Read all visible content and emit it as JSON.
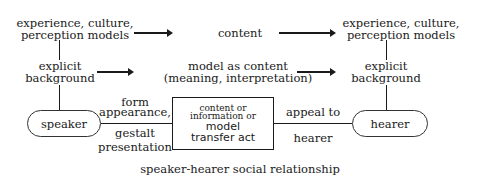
{
  "diagram": {
    "top_left": {
      "line1": "experience, culture,",
      "line2": "perception models"
    },
    "top_center": "content",
    "top_right": {
      "line1": "experience, culture,",
      "line2": "perception models"
    },
    "mid_left": {
      "line1": "explicit",
      "line2": "background"
    },
    "mid_center": {
      "line1": "model as content",
      "line2": "(meaning, interpretation)"
    },
    "mid_right": {
      "line1": "explicit",
      "line2": "background"
    },
    "speaker": "speaker",
    "hearer": "hearer",
    "left_edge_top": {
      "line1": "form",
      "line2": "appearance,"
    },
    "left_edge_bottom": {
      "line1": "gestalt",
      "line2": "presentation"
    },
    "center_box": {
      "line1": "content or",
      "line2": "information or",
      "line3": "model",
      "line4": "transfer act"
    },
    "right_edge_top": "appeal to",
    "right_edge_bottom": "hearer",
    "caption": "speaker-hearer social relationship"
  }
}
